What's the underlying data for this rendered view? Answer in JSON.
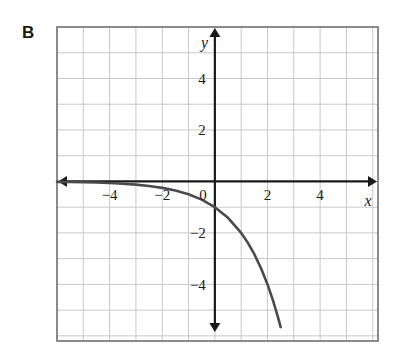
{
  "figure": {
    "panel_label": "B",
    "background_color": "#ffffff",
    "frame_color": "#6e6e6e",
    "grid_color": "#c8c8c8",
    "axis_color": "#1a1a1a",
    "curve_color": "#4a4a4a"
  },
  "chart_data": {
    "type": "line",
    "title": "",
    "subtitle": "",
    "xlabel": "x",
    "ylabel": "y",
    "xlim": [
      -6,
      6.2
    ],
    "ylim": [
      -6.2,
      6
    ],
    "xticks": [
      -4,
      -2,
      2,
      4
    ],
    "yticks": [
      -4,
      -2,
      2,
      4
    ],
    "xtick_labels": [
      "−4",
      "−2",
      "2",
      "4"
    ],
    "ytick_labels": [
      "−4",
      "−2",
      "2",
      "4"
    ],
    "origin_label": "0",
    "grid": true,
    "grid_step": 1,
    "legend": "none",
    "annotations": [],
    "series": [
      {
        "name": "y = -(2^x) + 0",
        "equation": "y = -2^x",
        "color": "#4a4a4a",
        "x": [
          -6.0,
          -5.5,
          -5.0,
          -4.5,
          -4.0,
          -3.5,
          -3.0,
          -2.5,
          -2.0,
          -1.5,
          -1.0,
          -0.5,
          0.0,
          0.5,
          1.0,
          1.25,
          1.5,
          1.75,
          2.0,
          2.2,
          2.4,
          2.5
        ],
        "y": [
          -0.016,
          -0.022,
          -0.031,
          -0.044,
          -0.063,
          -0.088,
          -0.125,
          -0.177,
          -0.25,
          -0.354,
          -0.5,
          -0.707,
          -1.0,
          -1.414,
          -2.0,
          -2.378,
          -2.828,
          -3.364,
          -4.0,
          -4.59,
          -5.28,
          -5.66
        ]
      }
    ]
  },
  "axis_arrows": {
    "x_left": "arrow",
    "x_right": "arrow",
    "y_top": "arrow",
    "y_bottom": "arrow"
  }
}
